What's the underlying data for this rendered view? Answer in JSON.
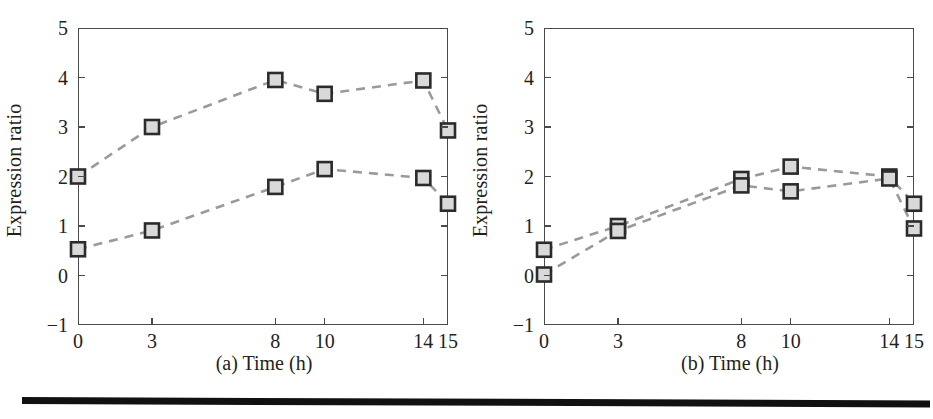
{
  "figure": {
    "background_color": "#ffffff",
    "ink_color": "#231f20",
    "axis_color": "#4a4a4a",
    "marker_face_color": "#d9d9d9",
    "marker_edge_color": "#2b2b2b",
    "line_color": "#9a9a9a",
    "rule_color": "#111111"
  },
  "chart_data": [
    {
      "type": "line",
      "panel_id": "a",
      "title": "",
      "xlabel": "(a) Time (h)",
      "ylabel": "Expression ratio",
      "x": [
        0,
        3,
        8,
        10,
        14,
        15
      ],
      "xtick_labels": [
        "0",
        "3",
        "8",
        "10",
        "14",
        "15"
      ],
      "ytick_labels": [
        "-1",
        "0",
        "1",
        "2",
        "3",
        "4",
        "5"
      ],
      "yticks": [
        -1,
        0,
        1,
        2,
        3,
        4,
        5
      ],
      "xlim": [
        0,
        15
      ],
      "ylim": [
        -1,
        5
      ],
      "grid": false,
      "legend": "none",
      "linestyle": "dashed",
      "marker": "square",
      "series": [
        {
          "name": "upper series",
          "values": [
            2.0,
            3.0,
            3.95,
            3.67,
            3.94,
            2.93
          ]
        },
        {
          "name": "lower series",
          "values": [
            0.53,
            0.91,
            1.79,
            2.15,
            1.97,
            1.45
          ]
        }
      ]
    },
    {
      "type": "line",
      "panel_id": "b",
      "title": "",
      "xlabel": "(b) Time (h)",
      "ylabel": "Expression ratio",
      "x": [
        0,
        3,
        8,
        10,
        14,
        15
      ],
      "xtick_labels": [
        "0",
        "3",
        "8",
        "10",
        "14",
        "15"
      ],
      "ytick_labels": [
        "-1",
        "0",
        "1",
        "2",
        "3",
        "4",
        "5"
      ],
      "yticks": [
        -1,
        0,
        1,
        2,
        3,
        4,
        5
      ],
      "xlim": [
        0,
        15
      ],
      "ylim": [
        -1,
        5
      ],
      "grid": false,
      "legend": "none",
      "linestyle": "dashed",
      "marker": "square",
      "series": [
        {
          "name": "upper series",
          "values": [
            0.52,
            1.0,
            1.95,
            2.2,
            2.0,
            1.45
          ]
        },
        {
          "name": "lower series",
          "values": [
            0.02,
            0.9,
            1.82,
            1.7,
            1.96,
            0.95
          ]
        }
      ]
    }
  ]
}
